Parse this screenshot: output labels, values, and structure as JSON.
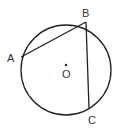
{
  "diagram": {
    "type": "circle-geometry",
    "circle": {
      "center": "O",
      "cx": 66,
      "cy": 70,
      "r": 45
    },
    "points": [
      {
        "id": "A",
        "label": "A",
        "x": 21,
        "y": 57,
        "lx": 7,
        "ly": 62
      },
      {
        "id": "B",
        "label": "B",
        "x": 86,
        "y": 22,
        "lx": 82,
        "ly": 17
      },
      {
        "id": "C",
        "label": "C",
        "x": 89,
        "y": 108,
        "lx": 88,
        "ly": 124
      },
      {
        "id": "O",
        "label": "O",
        "x": 66,
        "y": 65,
        "lx": 62,
        "ly": 78
      }
    ],
    "segments": [
      "AB",
      "BC"
    ],
    "stroke_color": "#222222"
  }
}
